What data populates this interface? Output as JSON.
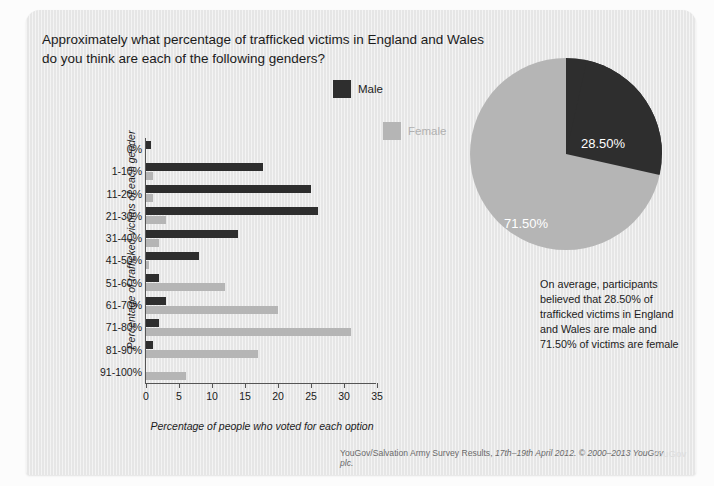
{
  "question": {
    "line1": "Approximately what percentage of trafficked victims in England and Wales",
    "line2": "do you think are each of the following genders?"
  },
  "legend": {
    "male": "Male",
    "female": "Female"
  },
  "colors": {
    "male": "#2e2e2e",
    "female": "#b5b5b5",
    "panel": "#e6e6e6",
    "axis": "#555555"
  },
  "pie": {
    "male_label": "28.50%",
    "female_label": "71.50%",
    "male_value": 28.5,
    "female_value": 71.5
  },
  "note": {
    "line1": "On average, participants",
    "line2": "believed that 28.50% of",
    "line3": "trafficked victims in England",
    "line4": "and Wales are male and",
    "line5": "71.50% of victims are female"
  },
  "footer": {
    "pre": "YouGov/Salvation Army Survey Results, ",
    "italic": "17th–19th April 2012. © 2000–2013 YouGov plc.",
    "watermark": "YouGov"
  },
  "chart_data": {
    "type": "bar",
    "orientation": "horizontal",
    "title": "",
    "xlabel": "Percentage of people who voted for each option",
    "ylabel": "Percentage of trafficked victims of each gender",
    "xlim": [
      0,
      35
    ],
    "xticks": [
      0,
      5,
      10,
      15,
      20,
      25,
      30,
      35
    ],
    "grid": false,
    "legend_position": "top-center",
    "categories": [
      "0%",
      "1-10%",
      "11-20%",
      "21-30%",
      "31-40%",
      "41-50%",
      "51-60%",
      "61-70%",
      "71-80%",
      "81-90%",
      "91-100%"
    ],
    "series": [
      {
        "name": "Male",
        "color": "#2e2e2e",
        "values": [
          0.7,
          17.8,
          25.0,
          26.0,
          14.0,
          8.0,
          2.0,
          3.0,
          2.0,
          1.0,
          0.0
        ]
      },
      {
        "name": "Female",
        "color": "#b5b5b5",
        "values": [
          0.0,
          1.0,
          1.0,
          3.0,
          2.0,
          0.5,
          12.0,
          20.0,
          31.0,
          17.0,
          6.0
        ]
      }
    ]
  },
  "pie_chart_data": {
    "type": "pie",
    "labels": [
      "Male",
      "Female"
    ],
    "values": [
      28.5,
      71.5
    ],
    "colors": [
      "#2e2e2e",
      "#b5b5b5"
    ],
    "data_labels": [
      "28.50%",
      "71.50%"
    ]
  }
}
